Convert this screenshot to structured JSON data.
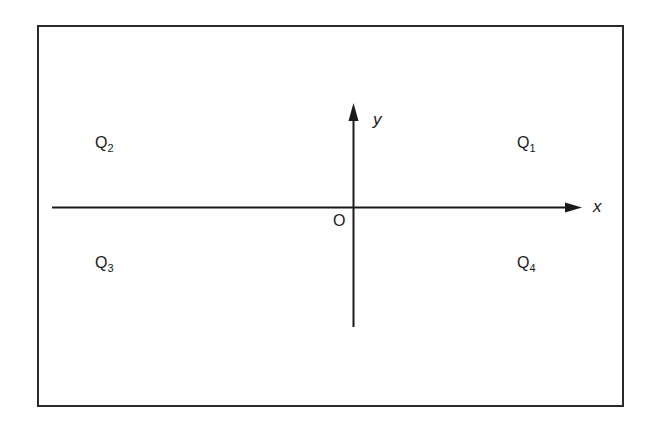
{
  "diagram": {
    "type": "cartesian-plane-quadrants",
    "colors": {
      "background": "#ffffff",
      "stroke": "#1a1a1a",
      "frame": "#2a2a2a"
    },
    "axes": {
      "x_label": "x",
      "y_label": "y",
      "origin_label": "O"
    },
    "quadrants": [
      {
        "id": "Q1",
        "base": "Q",
        "subscript": "1",
        "position": "upper-right"
      },
      {
        "id": "Q2",
        "base": "Q",
        "subscript": "2",
        "position": "upper-left"
      },
      {
        "id": "Q3",
        "base": "Q",
        "subscript": "3",
        "position": "lower-left"
      },
      {
        "id": "Q4",
        "base": "Q",
        "subscript": "4",
        "position": "lower-right"
      }
    ]
  }
}
